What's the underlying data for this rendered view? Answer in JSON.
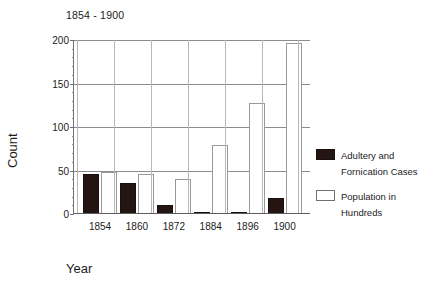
{
  "chart_data": {
    "type": "bar",
    "title": "1854 - 1900",
    "xlabel": "Year",
    "ylabel": "Count",
    "categories": [
      "1854",
      "1860",
      "1872",
      "1884",
      "1896",
      "1900"
    ],
    "series": [
      {
        "name": "Adultery and Fornication Cases",
        "color": "#241512",
        "values": [
          46,
          36,
          10,
          2,
          1,
          18
        ]
      },
      {
        "name": "Population in Hundreds",
        "color": "#ffffff",
        "values": [
          48,
          46,
          40,
          79,
          128,
          197
        ]
      }
    ],
    "ylim": [
      0,
      200
    ],
    "yticks": [
      0,
      50,
      100,
      150,
      200
    ],
    "ytick_labels": [
      "0",
      "50",
      "100",
      "150",
      "200"
    ],
    "grid": true,
    "legend_position": "right"
  },
  "legend": {
    "entries": [
      {
        "label_line1": "Adultery and",
        "label_line2": "Fornication Cases",
        "swatch": "black"
      },
      {
        "label_line1": "Population in",
        "label_line2": "Hundreds",
        "swatch": "white"
      }
    ]
  }
}
